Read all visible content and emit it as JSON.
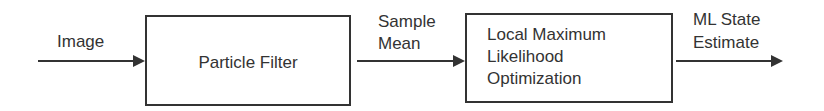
{
  "diagram": {
    "type": "flowchart",
    "inputs": {
      "image_label": "Image"
    },
    "nodes": [
      {
        "id": "particle-filter",
        "label": "Particle Filter"
      },
      {
        "id": "local-ml-opt",
        "lines": [
          "Local Maximum",
          "Likelihood",
          "Optimization"
        ]
      }
    ],
    "edges": [
      {
        "from": "input",
        "to": "particle-filter",
        "lines": [
          "Image"
        ]
      },
      {
        "from": "particle-filter",
        "to": "local-ml-opt",
        "lines": [
          "Sample",
          "Mean"
        ]
      },
      {
        "from": "local-ml-opt",
        "to": "output",
        "lines": [
          "ML State",
          "Estimate"
        ]
      }
    ],
    "colors": {
      "stroke": "#333333",
      "text": "#333333",
      "background": "#ffffff"
    }
  }
}
